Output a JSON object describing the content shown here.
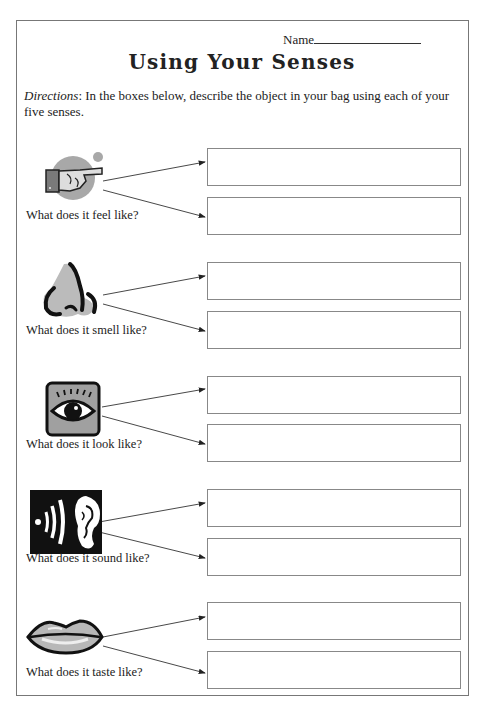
{
  "header": {
    "name_label": "Name",
    "title": "Using Your Senses"
  },
  "directions": {
    "label": "Directions",
    "text": ": In the boxes below, describe the object in your bag using each of your five senses."
  },
  "senses": [
    {
      "id": "touch",
      "icon": "pointing-hand-icon",
      "question": "What does it feel like?",
      "answer1": "",
      "answer2": ""
    },
    {
      "id": "smell",
      "icon": "nose-icon",
      "question": "What does it smell like?",
      "answer1": "",
      "answer2": ""
    },
    {
      "id": "sight",
      "icon": "eye-icon",
      "question": "What does it look like?",
      "answer1": "",
      "answer2": ""
    },
    {
      "id": "hearing",
      "icon": "ear-icon",
      "question": "What does it sound like?",
      "answer1": "",
      "answer2": ""
    },
    {
      "id": "taste",
      "icon": "lips-icon",
      "question": "What does it taste like?",
      "answer1": "",
      "answer2": ""
    }
  ],
  "colors": {
    "border": "#777777",
    "box_border": "#888888",
    "icon_gray": "#a8a8a8",
    "text": "#222222"
  }
}
